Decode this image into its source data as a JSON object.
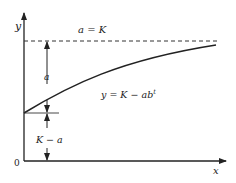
{
  "diagram": {
    "axes": {
      "x_label": "x",
      "y_label": "y",
      "origin_label": "0"
    },
    "asymptote": {
      "label": "a = K",
      "style": "dashed"
    },
    "curve": {
      "label": "y = K − ab",
      "label_exponent": "t"
    },
    "dimensions": {
      "upper_label": "a",
      "lower_label": "K − a"
    },
    "colors": {
      "line": "#222222",
      "background": "#ffffff"
    }
  }
}
